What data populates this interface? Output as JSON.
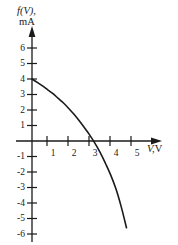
{
  "chart_data": {
    "type": "line",
    "title": "",
    "subtitle": "",
    "ylabel_variable": "f(V),",
    "ylabel_units": "mA",
    "xlabel_variable": "V,",
    "xlabel_units": "V",
    "xlabel_full": "V, V",
    "ylabel_full": "f(V), mA",
    "grid": false,
    "legend": null,
    "xlim": [
      0,
      5.9
    ],
    "ylim": [
      -6.6,
      6.6
    ],
    "x_ticks": [
      1,
      2,
      3,
      4,
      5
    ],
    "x_tick_labels": [
      "1",
      "2",
      "3",
      "4",
      "5"
    ],
    "y_ticks": [
      6,
      5,
      4,
      3,
      2,
      1,
      -1,
      -2,
      -3,
      -4,
      -5,
      -6
    ],
    "y_tick_labels": [
      "6",
      "5",
      "4",
      "3",
      "2",
      "1",
      "-1",
      "-2",
      "-3",
      "-4",
      "-5",
      "-6"
    ],
    "series": [
      {
        "name": "f(V)",
        "x": [
          0.0,
          0.25,
          0.5,
          0.75,
          1.0,
          1.25,
          1.5,
          1.75,
          2.0,
          2.25,
          2.5,
          2.75,
          3.0,
          3.25,
          3.5,
          3.75,
          4.0,
          4.25,
          4.5
        ],
        "y": [
          4.0,
          3.78,
          3.55,
          3.3,
          3.05,
          2.75,
          2.45,
          2.1,
          1.72,
          1.3,
          0.85,
          0.38,
          -0.15,
          -0.75,
          -1.45,
          -2.2,
          -3.1,
          -4.25,
          -5.6
        ]
      }
    ],
    "x_intercept": 2.95,
    "y_intercept": 4.0,
    "curve_end": {
      "x": 4.5,
      "y": -5.6
    },
    "axis_color": "#1a1a1a",
    "curve_color": "#1a1a1a",
    "background_color": "#ffffff"
  }
}
